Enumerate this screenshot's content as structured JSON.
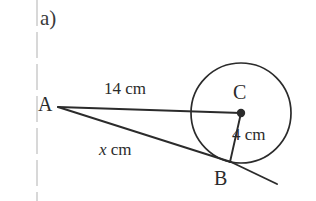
{
  "figure": {
    "part_label": "a)",
    "background_color": "#ffffff",
    "ink_color": "#2b2b2b",
    "margin_rule_color": "#d8d8d8",
    "points": {
      "A": {
        "label": "A",
        "x": 58,
        "y": 107
      },
      "B": {
        "label": "B",
        "x": 231,
        "y": 162
      },
      "C": {
        "label": "C",
        "x": 241,
        "y": 113
      }
    },
    "circle": {
      "center_x": 241,
      "center_y": 113,
      "radius": 50
    },
    "segments": [
      {
        "name": "segment-AC",
        "from": "A",
        "to": "C",
        "length_label": "14 cm"
      },
      {
        "name": "segment-AB",
        "from": "A",
        "to": "B",
        "length_label": "x cm"
      },
      {
        "name": "segment-CB",
        "from": "C",
        "to": "B",
        "length_label": "4 cm"
      }
    ],
    "labels": {
      "ac_length": "14 cm",
      "ab_length_variable": "x",
      "ab_length_unit": "cm",
      "cb_length": "4 cm"
    },
    "tangent_extension": {
      "name": "tangent-line-extension",
      "to_x": 277,
      "to_y": 184
    }
  }
}
